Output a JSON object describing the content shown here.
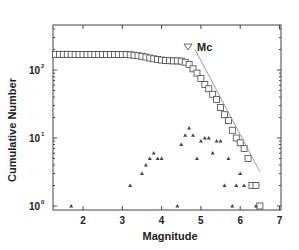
{
  "chart_data": {
    "type": "scatter",
    "title": "",
    "xlabel": "Magnitude",
    "ylabel": "Cumulative Number",
    "xlim": [
      1.25,
      7
    ],
    "ylim": [
      0.9,
      550
    ],
    "yscale": "log",
    "grid": false,
    "x_ticks": [
      2,
      3,
      4,
      5,
      6,
      7
    ],
    "y_ticks": [
      {
        "value": 1,
        "label": "10",
        "exp": "0"
      },
      {
        "value": 10,
        "label": "10",
        "exp": "1"
      },
      {
        "value": 100,
        "label": "10",
        "exp": "2"
      }
    ],
    "annotation": {
      "label": "Mc",
      "marker": "inverted-triangle",
      "x": 4.85,
      "y": 230
    },
    "series": [
      {
        "name": "Cumulative number",
        "marker": "square",
        "x": [
          1.3,
          1.4,
          1.5,
          1.6,
          1.7,
          1.8,
          1.9,
          2.0,
          2.1,
          2.2,
          2.3,
          2.4,
          2.5,
          2.6,
          2.7,
          2.8,
          2.9,
          3.0,
          3.1,
          3.2,
          3.3,
          3.4,
          3.5,
          3.6,
          3.7,
          3.8,
          3.9,
          4.0,
          4.1,
          4.2,
          4.3,
          4.4,
          4.5,
          4.6,
          4.7,
          4.8,
          4.9,
          5.0,
          5.1,
          5.2,
          5.3,
          5.4,
          5.5,
          5.6,
          5.7,
          5.8,
          5.9,
          6.0,
          6.1,
          6.2,
          6.3,
          6.4,
          6.5
        ],
        "y": [
          170,
          170,
          170,
          170,
          170,
          169,
          169,
          169,
          169,
          169,
          169,
          169,
          169,
          169,
          169,
          169,
          169,
          169,
          169,
          167,
          165,
          162,
          159,
          155,
          150,
          146,
          143,
          140,
          138,
          137,
          136,
          136,
          135,
          130,
          121,
          104,
          90,
          75,
          61,
          53,
          44,
          37,
          28,
          22,
          18,
          13,
          10,
          8.5,
          7,
          5,
          2,
          2,
          1
        ]
      },
      {
        "name": "Non-cumulative number",
        "marker": "triangle",
        "x": [
          1.7,
          3.2,
          3.5,
          3.6,
          3.7,
          3.8,
          3.9,
          4.0,
          4.4,
          4.5,
          4.6,
          4.7,
          4.8,
          4.9,
          5.0,
          5.1,
          5.2,
          5.3,
          5.4,
          5.5,
          5.6,
          5.7,
          5.8,
          5.9,
          6.0,
          6.1,
          6.4
        ],
        "y": [
          1,
          2,
          3,
          4,
          5,
          6,
          5,
          5,
          1,
          8,
          11,
          14,
          11,
          5,
          9,
          10,
          10,
          6,
          9,
          9,
          2,
          5,
          1,
          2,
          3,
          2,
          1
        ]
      },
      {
        "name": "Gutenberg-Richter fit",
        "type": "line",
        "x": [
          4.85,
          6.5
        ],
        "y": [
          200,
          3.2
        ]
      }
    ]
  }
}
